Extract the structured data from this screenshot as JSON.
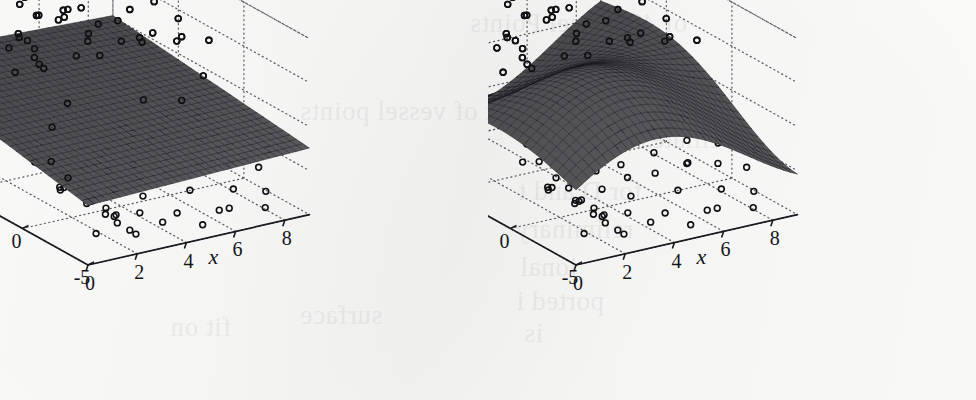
{
  "figure": {
    "kind": "two-panel 3d surface + scatter figure",
    "paper_color": "#fbfbfa",
    "ink_color": "#15151a",
    "surface_color": "#3a3a40",
    "grid_color": "#5b5b63",
    "ghost_text": [
      {
        "text": "of 49 Vessel Points",
        "x": 470,
        "y": 8
      },
      {
        "text": "main",
        "x": 60,
        "y": 44
      },
      {
        "text": "the ei",
        "x": 520,
        "y": 56
      },
      {
        "text": "Ovary",
        "x": 92,
        "y": 70
      },
      {
        "text": "ot of vessel points",
        "x": 300,
        "y": 96
      },
      {
        "text": "s ciliates and tissue",
        "x": 520,
        "y": 124
      },
      {
        "text": "for D and t",
        "x": 518,
        "y": 176
      },
      {
        "text": "reliminary",
        "x": 515,
        "y": 214
      },
      {
        "text": "ional",
        "x": 520,
        "y": 252
      },
      {
        "text": "ported i",
        "x": 516,
        "y": 286
      },
      {
        "text": "is",
        "x": 524,
        "y": 318
      },
      {
        "text": "surface",
        "x": 300,
        "y": 300
      },
      {
        "text": "fit on",
        "x": 170,
        "y": 312
      }
    ]
  },
  "chart_data": [
    {
      "panel": "left",
      "type": "surface",
      "title": "",
      "xlabel": "x",
      "ylabel": "y",
      "zlabel": "z",
      "xlim": [
        0,
        9
      ],
      "ylim": [
        -5,
        10
      ],
      "zlim": [
        -1,
        1
      ],
      "xticks": [
        0,
        2,
        4,
        6,
        8
      ],
      "xticklabels": [
        "0",
        "2",
        "4",
        "6",
        "8"
      ],
      "yticks": [
        10,
        5,
        0,
        -5
      ],
      "yticklabels": [
        "10",
        "5",
        "0",
        "-5"
      ],
      "zticks": [
        1,
        0.5,
        0,
        -0.5,
        -1
      ],
      "zticklabels": [
        "1",
        "0.5",
        "0",
        "-0.5",
        "-1"
      ],
      "grid": true,
      "legend": "none",
      "surface_model": "nearly planar tilted fit, slight downward slope toward the front-left (low y, low x) corner",
      "surface_shape": {
        "kind": "plane",
        "z0": -0.05,
        "slope_x": 0.012,
        "slope_y": 0.01,
        "amp": 0.0,
        "period_x": 9,
        "period_y": 15,
        "tilt": 0.02
      },
      "surface_mesh_nx": 34,
      "surface_mesh_ny": 30,
      "n_points": 118,
      "marker": "open-circle",
      "marker_radius_px": 2.9,
      "scatter": [
        [
          0.1,
          -2.0,
          -0.08
        ],
        [
          0.2,
          -3.1,
          -0.18
        ],
        [
          0.45,
          -3.6,
          -0.27
        ],
        [
          0.7,
          -4.1,
          -0.38
        ],
        [
          1.05,
          -4.4,
          -0.47
        ],
        [
          1.4,
          -3.7,
          -0.62
        ],
        [
          1.75,
          -3.95,
          -0.72
        ],
        [
          2.1,
          -4.25,
          -0.8
        ],
        [
          0.3,
          1.6,
          0.9
        ],
        [
          0.55,
          3.1,
          0.41
        ],
        [
          0.95,
          2.35,
          0.52
        ],
        [
          1.25,
          4.6,
          0.93
        ],
        [
          1.4,
          2.95,
          0.88
        ],
        [
          1.7,
          5.4,
          1.0
        ],
        [
          1.85,
          3.1,
          0.76
        ],
        [
          2.05,
          4.1,
          0.7
        ],
        [
          2.25,
          2.6,
          0.46
        ],
        [
          2.4,
          3.6,
          0.49
        ],
        [
          2.55,
          5.0,
          0.97
        ],
        [
          2.7,
          3.8,
          0.38
        ],
        [
          2.95,
          4.3,
          0.88
        ],
        [
          3.2,
          1.9,
          0.6
        ],
        [
          3.4,
          3.2,
          0.92
        ],
        [
          3.55,
          5.6,
          0.73
        ],
        [
          3.8,
          2.1,
          0.8
        ],
        [
          4.0,
          4.4,
          0.86
        ],
        [
          4.2,
          2.9,
          0.62
        ],
        [
          4.45,
          4.9,
          0.8
        ],
        [
          4.7,
          6.2,
          1.0
        ],
        [
          4.95,
          3.4,
          0.37
        ],
        [
          5.1,
          5.1,
          0.76
        ],
        [
          5.35,
          2.5,
          0.58
        ],
        [
          5.55,
          4.8,
          0.92
        ],
        [
          5.7,
          6.4,
          0.96
        ],
        [
          5.95,
          3.9,
          0.66
        ],
        [
          6.15,
          5.5,
          0.88
        ],
        [
          6.35,
          2.8,
          0.48
        ],
        [
          6.6,
          4.2,
          0.72
        ],
        [
          6.8,
          6.0,
          0.94
        ],
        [
          7.05,
          3.3,
          0.5
        ],
        [
          7.3,
          5.0,
          0.84
        ],
        [
          7.55,
          2.4,
          0.45
        ],
        [
          7.8,
          4.6,
          0.7
        ],
        [
          8.05,
          6.1,
          0.9
        ],
        [
          8.3,
          3.7,
          0.55
        ],
        [
          8.55,
          5.3,
          0.78
        ],
        [
          8.75,
          2.2,
          0.4
        ],
        [
          0.9,
          -1.2,
          -0.52
        ],
        [
          1.3,
          -0.4,
          -0.58
        ],
        [
          1.6,
          -1.9,
          -0.66
        ],
        [
          1.95,
          0.5,
          -0.7
        ],
        [
          2.2,
          -1.1,
          -0.74
        ],
        [
          2.45,
          -2.4,
          -0.82
        ],
        [
          2.7,
          0.1,
          -0.86
        ],
        [
          2.95,
          -1.6,
          -0.9
        ],
        [
          3.15,
          1.2,
          -0.6
        ],
        [
          3.4,
          -0.6,
          -0.72
        ],
        [
          3.65,
          -2.1,
          -0.88
        ],
        [
          3.9,
          0.8,
          -0.66
        ],
        [
          4.15,
          -1.4,
          -0.78
        ],
        [
          4.4,
          1.9,
          -0.55
        ],
        [
          4.65,
          -0.2,
          -0.7
        ],
        [
          4.9,
          -2.6,
          -0.92
        ],
        [
          5.15,
          1.4,
          -0.5
        ],
        [
          5.4,
          -0.9,
          -0.64
        ],
        [
          5.65,
          2.2,
          -0.46
        ],
        [
          5.9,
          -1.7,
          -0.8
        ],
        [
          6.15,
          0.6,
          -0.58
        ],
        [
          6.4,
          -3.0,
          -0.95
        ],
        [
          6.65,
          1.8,
          -0.44
        ],
        [
          6.9,
          -0.5,
          -0.66
        ],
        [
          7.15,
          2.6,
          -0.4
        ],
        [
          7.4,
          -2.2,
          -0.84
        ],
        [
          7.65,
          0.9,
          -0.56
        ],
        [
          7.9,
          -1.0,
          -0.68
        ],
        [
          8.15,
          2.0,
          -0.42
        ],
        [
          8.4,
          -2.8,
          -0.88
        ],
        [
          8.6,
          0.3,
          -0.6
        ],
        [
          8.8,
          -1.5,
          -0.74
        ],
        [
          1.1,
          6.8,
          0.99
        ],
        [
          2.3,
          7.4,
          0.95
        ],
        [
          3.6,
          6.6,
          0.85
        ],
        [
          4.8,
          7.8,
          0.98
        ],
        [
          6.0,
          7.1,
          0.91
        ],
        [
          7.2,
          6.9,
          0.88
        ],
        [
          8.45,
          7.6,
          0.93
        ],
        [
          1.5,
          -2.8,
          -0.92
        ],
        [
          2.8,
          -3.4,
          -0.96
        ],
        [
          4.1,
          -3.0,
          -0.94
        ],
        [
          5.3,
          -3.8,
          -0.98
        ],
        [
          6.7,
          -3.2,
          -0.93
        ],
        [
          7.95,
          -3.6,
          -0.97
        ],
        [
          0.6,
          0.2,
          -0.3
        ],
        [
          1.2,
          1.0,
          -0.2
        ],
        [
          2.0,
          1.5,
          -0.1
        ],
        [
          3.0,
          2.2,
          0.05
        ],
        [
          4.3,
          0.4,
          -0.15
        ],
        [
          5.5,
          1.1,
          0.02
        ],
        [
          6.9,
          0.8,
          -0.05
        ],
        [
          8.2,
          1.6,
          0.08
        ],
        [
          0.4,
          4.2,
          0.55
        ],
        [
          1.8,
          6.0,
          0.68
        ],
        [
          3.1,
          4.9,
          0.44
        ],
        [
          4.55,
          5.8,
          0.6
        ],
        [
          5.85,
          5.2,
          0.52
        ],
        [
          7.1,
          4.4,
          0.35
        ],
        [
          8.6,
          4.0,
          0.3
        ],
        [
          2.6,
          -0.8,
          -0.36
        ],
        [
          3.85,
          -1.2,
          -0.42
        ],
        [
          5.05,
          -0.3,
          -0.28
        ],
        [
          6.25,
          -1.8,
          -0.5
        ],
        [
          7.45,
          -0.7,
          -0.34
        ],
        [
          8.7,
          -2.4,
          -0.46
        ]
      ]
    },
    {
      "panel": "right",
      "type": "surface",
      "title": "",
      "xlabel": "x",
      "ylabel": "y",
      "zlabel": "z",
      "xlim": [
        0,
        9
      ],
      "ylim": [
        -5,
        10
      ],
      "zlim": [
        -1,
        1
      ],
      "xticks": [
        0,
        2,
        4,
        6,
        8
      ],
      "xticklabels": [
        "0",
        "2",
        "4",
        "6",
        "8"
      ],
      "yticks": [
        10,
        5,
        0,
        -5
      ],
      "yticklabels": [
        "10",
        "5",
        "0",
        "-5"
      ],
      "zticks": [
        1,
        0.5,
        0,
        -0.5,
        -1
      ],
      "zticklabels": [
        "1",
        "0.5",
        "0",
        "-0.5",
        "-1"
      ],
      "grid": true,
      "legend": "none",
      "surface_model": "flexible saddle / wave fit: rises to a ridge near mid-x at high y and dips to a trough at low y, twisting across the domain",
      "surface_shape": {
        "kind": "saddle",
        "z0": -0.02,
        "slope_x": 0.0,
        "slope_y": 0.0,
        "amp": 0.62,
        "period_x": 11.0,
        "period_y": 20.0,
        "tilt": 0.055
      },
      "surface_mesh_nx": 34,
      "surface_mesh_ny": 30,
      "n_points": 118,
      "marker": "open-circle",
      "marker_radius_px": 2.9,
      "scatter": [
        [
          0.1,
          -2.0,
          -0.08
        ],
        [
          0.2,
          -3.1,
          -0.18
        ],
        [
          0.45,
          -3.6,
          -0.27
        ],
        [
          0.7,
          -4.1,
          -0.38
        ],
        [
          1.05,
          -4.4,
          -0.47
        ],
        [
          1.4,
          -3.7,
          -0.62
        ],
        [
          1.75,
          -3.95,
          -0.72
        ],
        [
          2.1,
          -4.25,
          -0.8
        ],
        [
          0.3,
          1.6,
          0.9
        ],
        [
          0.55,
          3.1,
          0.41
        ],
        [
          0.95,
          2.35,
          0.52
        ],
        [
          1.25,
          4.6,
          0.93
        ],
        [
          1.4,
          2.95,
          0.88
        ],
        [
          1.7,
          5.4,
          1.0
        ],
        [
          1.85,
          3.1,
          0.76
        ],
        [
          2.05,
          4.1,
          0.7
        ],
        [
          2.25,
          2.6,
          0.46
        ],
        [
          2.4,
          3.6,
          0.49
        ],
        [
          2.55,
          5.0,
          0.97
        ],
        [
          2.7,
          3.8,
          0.38
        ],
        [
          2.95,
          4.3,
          0.88
        ],
        [
          3.2,
          1.9,
          0.6
        ],
        [
          3.4,
          3.2,
          0.92
        ],
        [
          3.55,
          5.6,
          0.73
        ],
        [
          3.8,
          2.1,
          0.8
        ],
        [
          4.0,
          4.4,
          0.86
        ],
        [
          4.2,
          2.9,
          0.62
        ],
        [
          4.45,
          4.9,
          0.8
        ],
        [
          4.7,
          6.2,
          1.0
        ],
        [
          4.95,
          3.4,
          0.37
        ],
        [
          5.1,
          5.1,
          0.76
        ],
        [
          5.35,
          2.5,
          0.58
        ],
        [
          5.55,
          4.8,
          0.92
        ],
        [
          5.7,
          6.4,
          0.96
        ],
        [
          5.95,
          3.9,
          0.66
        ],
        [
          6.15,
          5.5,
          0.88
        ],
        [
          6.35,
          2.8,
          0.48
        ],
        [
          6.6,
          4.2,
          0.72
        ],
        [
          6.8,
          6.0,
          0.94
        ],
        [
          7.05,
          3.3,
          0.5
        ],
        [
          7.3,
          5.0,
          0.84
        ],
        [
          7.55,
          2.4,
          0.45
        ],
        [
          7.8,
          4.6,
          0.7
        ],
        [
          8.05,
          6.1,
          0.9
        ],
        [
          8.3,
          3.7,
          0.55
        ],
        [
          8.55,
          5.3,
          0.78
        ],
        [
          8.75,
          2.2,
          0.4
        ],
        [
          0.9,
          -1.2,
          -0.52
        ],
        [
          1.3,
          -0.4,
          -0.58
        ],
        [
          1.6,
          -1.9,
          -0.66
        ],
        [
          1.95,
          0.5,
          -0.7
        ],
        [
          2.2,
          -1.1,
          -0.74
        ],
        [
          2.45,
          -2.4,
          -0.82
        ],
        [
          2.7,
          0.1,
          -0.86
        ],
        [
          2.95,
          -1.6,
          -0.9
        ],
        [
          3.15,
          1.2,
          -0.6
        ],
        [
          3.4,
          -0.6,
          -0.72
        ],
        [
          3.65,
          -2.1,
          -0.88
        ],
        [
          3.9,
          0.8,
          -0.66
        ],
        [
          4.15,
          -1.4,
          -0.78
        ],
        [
          4.4,
          1.9,
          -0.55
        ],
        [
          4.65,
          -0.2,
          -0.7
        ],
        [
          4.9,
          -2.6,
          -0.92
        ],
        [
          5.15,
          1.4,
          -0.5
        ],
        [
          5.4,
          -0.9,
          -0.64
        ],
        [
          5.65,
          2.2,
          -0.46
        ],
        [
          5.9,
          -1.7,
          -0.8
        ],
        [
          6.15,
          0.6,
          -0.58
        ],
        [
          6.4,
          -3.0,
          -0.95
        ],
        [
          6.65,
          1.8,
          -0.44
        ],
        [
          6.9,
          -0.5,
          -0.66
        ],
        [
          7.15,
          2.6,
          -0.4
        ],
        [
          7.4,
          -2.2,
          -0.84
        ],
        [
          7.65,
          0.9,
          -0.56
        ],
        [
          7.9,
          -1.0,
          -0.68
        ],
        [
          8.15,
          2.0,
          -0.42
        ],
        [
          8.4,
          -2.8,
          -0.88
        ],
        [
          8.6,
          0.3,
          -0.6
        ],
        [
          8.8,
          -1.5,
          -0.74
        ],
        [
          1.1,
          6.8,
          0.99
        ],
        [
          2.3,
          7.4,
          0.95
        ],
        [
          3.6,
          6.6,
          0.85
        ],
        [
          4.8,
          7.8,
          0.98
        ],
        [
          6.0,
          7.1,
          0.91
        ],
        [
          7.2,
          6.9,
          0.88
        ],
        [
          8.45,
          7.6,
          0.93
        ],
        [
          1.5,
          -2.8,
          -0.92
        ],
        [
          2.8,
          -3.4,
          -0.96
        ],
        [
          4.1,
          -3.0,
          -0.94
        ],
        [
          5.3,
          -3.8,
          -0.98
        ],
        [
          6.7,
          -3.2,
          -0.93
        ],
        [
          7.95,
          -3.6,
          -0.97
        ],
        [
          0.6,
          0.2,
          -0.3
        ],
        [
          1.2,
          1.0,
          -0.2
        ],
        [
          2.0,
          1.5,
          -0.1
        ],
        [
          3.0,
          2.2,
          0.05
        ],
        [
          4.3,
          0.4,
          -0.15
        ],
        [
          5.5,
          1.1,
          0.02
        ],
        [
          6.9,
          0.8,
          -0.05
        ],
        [
          8.2,
          1.6,
          0.08
        ],
        [
          0.4,
          4.2,
          0.55
        ],
        [
          1.8,
          6.0,
          0.68
        ],
        [
          3.1,
          4.9,
          0.44
        ],
        [
          4.55,
          5.8,
          0.6
        ],
        [
          5.85,
          5.2,
          0.52
        ],
        [
          7.1,
          4.4,
          0.35
        ],
        [
          8.6,
          4.0,
          0.3
        ],
        [
          2.6,
          -0.8,
          -0.36
        ],
        [
          3.85,
          -1.2,
          -0.42
        ],
        [
          5.05,
          -0.3,
          -0.28
        ],
        [
          6.25,
          -1.8,
          -0.5
        ],
        [
          7.45,
          -0.7,
          -0.34
        ],
        [
          8.7,
          -2.4,
          -0.46
        ]
      ]
    }
  ]
}
